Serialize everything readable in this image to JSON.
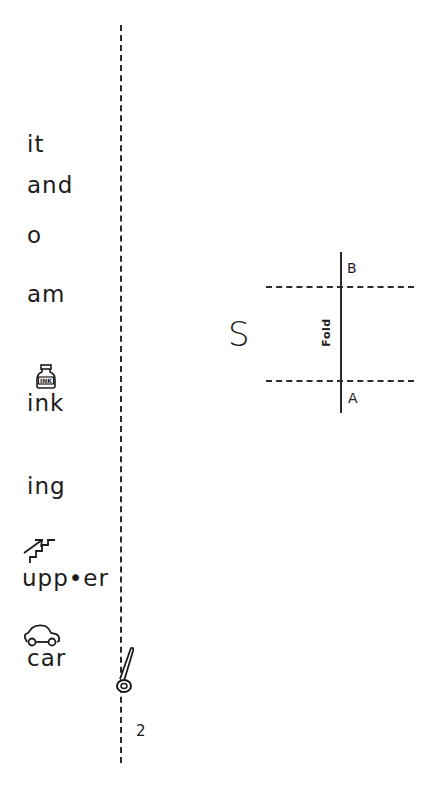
{
  "word_list": {
    "words": [
      {
        "text": "it",
        "top": 133
      },
      {
        "text": "and",
        "top": 174
      },
      {
        "text": "o",
        "top": 224
      },
      {
        "text": "am",
        "top": 283
      },
      {
        "text": "ink",
        "top": 392,
        "icon": "ink-bottle-icon"
      },
      {
        "text": "ing",
        "top": 475
      },
      {
        "text": "upp•er",
        "top": 567,
        "icon": "stairs-up-icon"
      },
      {
        "text": "car",
        "top": 647,
        "icon": "car-icon"
      }
    ]
  },
  "cut_line": {
    "icon": "scissors-icon",
    "style": "dashed"
  },
  "fold_diagram": {
    "letter": "S",
    "fold_label": "Fold",
    "top_marker": "B",
    "bottom_marker": "A"
  },
  "page_number": "2",
  "colors": {
    "ink": "#1c1c1c",
    "background": "#ffffff"
  }
}
